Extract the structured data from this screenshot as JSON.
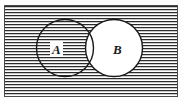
{
  "figure": {
    "kind": "venn-diagram",
    "caption": "",
    "universe": {
      "name": "universal-set-rectangle",
      "shading": "horizontal-hatch",
      "x": 5,
      "y": 6,
      "width": 173,
      "height": 91
    },
    "sets": [
      {
        "id": "A",
        "label": "A",
        "shaded": true,
        "cx": 65,
        "cy": 48,
        "r": 28.5
      },
      {
        "id": "B",
        "label": "B",
        "shaded": false,
        "cx": 114,
        "cy": 48,
        "r": 28.5
      }
    ],
    "regions": [
      {
        "name": "A-only",
        "shaded": true
      },
      {
        "name": "A-intersect-B",
        "shaded": false
      },
      {
        "name": "B-only",
        "shaded": false
      },
      {
        "name": "outside-both",
        "shaded": true
      }
    ],
    "shaded_meaning": "complement of B",
    "colors": {
      "hatch_line": "#2b2b2b",
      "background": "#ffffff",
      "circle_stroke": "#1a1a1a",
      "frame_stroke": "#4a4a4a",
      "label_text": "#1a1a1a"
    },
    "hatch": {
      "orientation": "horizontal",
      "period_px": 3,
      "line_width_px": 1.2
    }
  }
}
